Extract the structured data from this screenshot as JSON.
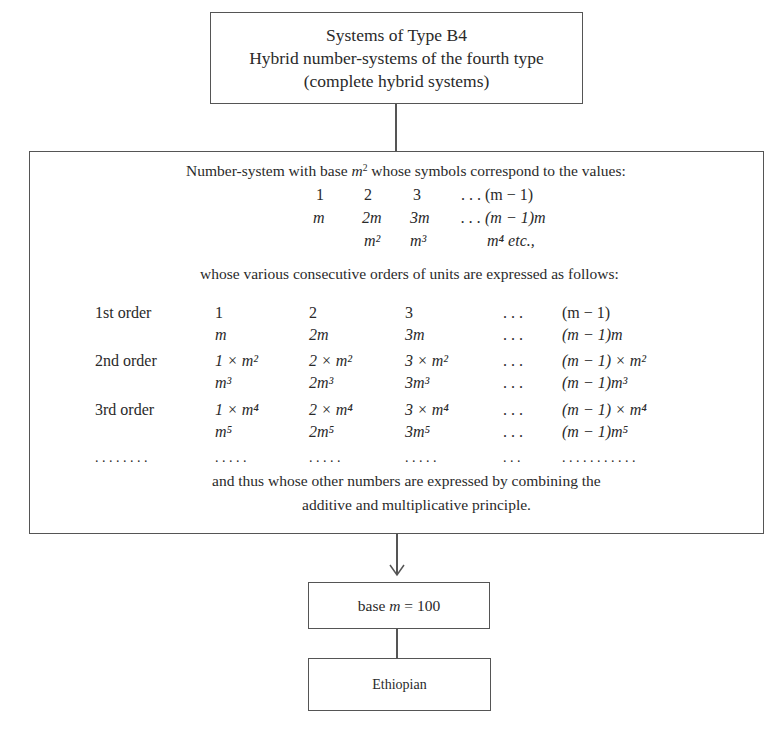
{
  "title_box": {
    "line1": "Systems of Type B4",
    "line2": "Hybrid number-systems of the fourth type",
    "line3": "(complete hybrid systems)"
  },
  "main_box": {
    "intro": {
      "prefix": "Number-system with base ",
      "base_var": "m",
      "base_exp": "2",
      "suffix": " whose symbols correspond to the values:"
    },
    "values_table": [
      [
        "1",
        "2",
        "3",
        ". . . (m − 1)"
      ],
      [
        "m",
        "2m",
        "3m",
        ". . . (m − 1)m"
      ],
      [
        "",
        "m²",
        "m³",
        "m⁴  etc.,"
      ]
    ],
    "orders_intro": "whose various consecutive orders of units are expressed as follows:",
    "orders": [
      {
        "label": "1st order",
        "rows": [
          [
            "1",
            "2",
            "3",
            ". . .",
            "(m − 1)"
          ],
          [
            "m",
            "2m",
            "3m",
            ". . .",
            "(m − 1)m"
          ]
        ]
      },
      {
        "label": "2nd order",
        "rows": [
          [
            "1 × m²",
            "2 × m²",
            "3 × m²",
            ". . .",
            "(m − 1) × m²"
          ],
          [
            "m³",
            "2m³",
            "3m³",
            ". . .",
            "(m − 1)m³"
          ]
        ]
      },
      {
        "label": "3rd order",
        "rows": [
          [
            "1 × m⁴",
            "2 × m⁴",
            "3 × m⁴",
            ". . .",
            "(m − 1) × m⁴"
          ],
          [
            "m⁵",
            "2m⁵",
            "3m⁵",
            ". . .",
            "(m − 1)m⁵"
          ]
        ]
      }
    ],
    "ellipsis_row": [
      ". . . . . . . .",
      ". . . . .",
      ". . . . .",
      ". . . . .",
      ". . .",
      ". . . . . . . . . . ."
    ],
    "conclusion_line1": "and thus whose other numbers are expressed by combining the",
    "conclusion_line2": "additive and multiplicative principle."
  },
  "base_box": {
    "prefix": "base ",
    "var": "m",
    "suffix": " = 100"
  },
  "result_box": {
    "label": "Ethiopian"
  },
  "colors": {
    "line": "#555555",
    "text": "#2a2a2a",
    "background": "#ffffff"
  }
}
